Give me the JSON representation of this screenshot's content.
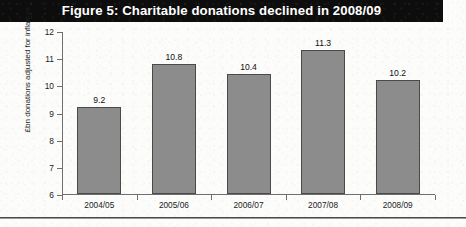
{
  "figure": {
    "title": "Figure 5: Charitable donations declined in 2008/09",
    "title_bar_color": "#0d0d0d",
    "title_text_color": "#ffffff"
  },
  "chart_data": {
    "type": "bar",
    "title": "Figure 5: Charitable donations declined in 2008/09",
    "categories": [
      "2004/05",
      "2005/06",
      "2006/07",
      "2007/08",
      "2008/09"
    ],
    "values": [
      9.2,
      10.8,
      10.4,
      11.3,
      10.2
    ],
    "value_labels": [
      "9.2",
      "10.8",
      "10.4",
      "11.3",
      "10.2"
    ],
    "xlabel": "",
    "ylabel": "£bn donations adjusted for inflation",
    "ylim": [
      6,
      12
    ],
    "yticks": [
      6,
      7,
      8,
      9,
      10,
      11,
      12
    ],
    "ytick_labels": [
      "6",
      "7",
      "8",
      "9",
      "10",
      "11",
      "12"
    ],
    "grid": false,
    "legend": null,
    "bar_color": "#8c8c8c",
    "bar_edge_color": "#4a4a4a",
    "axis_color": "#6f6f6f"
  }
}
